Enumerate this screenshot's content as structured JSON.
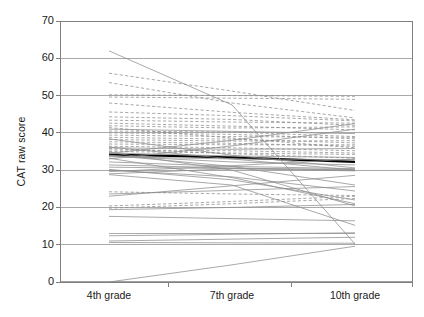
{
  "chart_data": {
    "type": "line",
    "title": "",
    "subtitle": "",
    "xlabel": "",
    "ylabel": "CAT raw score",
    "categories": [
      "4th grade",
      "7th grade",
      "10th grade"
    ],
    "x_tick_labels": [
      "4th grade",
      "7th grade",
      "10th grade"
    ],
    "y_tick_labels": [
      "0",
      "10",
      "20",
      "30",
      "40",
      "50",
      "60",
      "70"
    ],
    "y_ticks": [
      0,
      10,
      20,
      30,
      40,
      50,
      60,
      70
    ],
    "ylim": [
      0,
      70
    ],
    "grid": "horizontal",
    "legend": "none",
    "legend_position": "none",
    "note": "Spaghetti plot: one line per individual across three grades; mix of solid and dashed grey lines with one bold black mean line.",
    "colors": {
      "axis": "#808080",
      "grid": "#a0a0a0",
      "line_solid": "#8c8c8c",
      "line_dashed": "#8c8c8c",
      "line_highlight": "#000000",
      "background": "#ffffff",
      "text": "#1a1a1a"
    },
    "series": [
      {
        "name": "mean",
        "style": "solid-bold",
        "color": "#000000",
        "width": 2.2,
        "values": [
          34.2,
          33.4,
          32.2
        ]
      },
      {
        "name": "s01",
        "style": "solid",
        "values": [
          62.0,
          47.5,
          10.2
        ]
      },
      {
        "name": "s02",
        "style": "dashed",
        "values": [
          56.0,
          51.2,
          46.0
        ]
      },
      {
        "name": "s03",
        "style": "dashed",
        "values": [
          53.5,
          48.0,
          44.0
        ]
      },
      {
        "name": "s04",
        "style": "dashed",
        "values": [
          50.2,
          50.0,
          49.8
        ]
      },
      {
        "name": "s05",
        "style": "dashed",
        "values": [
          49.6,
          49.3,
          49.0
        ]
      },
      {
        "name": "s06",
        "style": "dashed",
        "values": [
          48.0,
          45.5,
          43.5
        ]
      },
      {
        "name": "s07",
        "style": "dashed",
        "values": [
          45.6,
          44.6,
          43.2
        ]
      },
      {
        "name": "s08",
        "style": "dashed",
        "values": [
          44.3,
          43.6,
          42.0
        ]
      },
      {
        "name": "s09",
        "style": "dashed",
        "values": [
          43.4,
          42.9,
          42.6
        ]
      },
      {
        "name": "s10",
        "style": "dashed",
        "values": [
          42.6,
          41.8,
          40.8
        ]
      },
      {
        "name": "s11",
        "style": "dashed",
        "values": [
          41.9,
          41.3,
          41.6
        ]
      },
      {
        "name": "s12",
        "style": "solid",
        "values": [
          41.0,
          40.4,
          39.8
        ]
      },
      {
        "name": "s13",
        "style": "dashed",
        "values": [
          40.5,
          40.2,
          39.0
        ]
      },
      {
        "name": "s14",
        "style": "dashed",
        "values": [
          40.0,
          39.6,
          38.4
        ]
      },
      {
        "name": "s15",
        "style": "dashed",
        "values": [
          39.4,
          39.0,
          38.8
        ]
      },
      {
        "name": "s16",
        "style": "dashed",
        "values": [
          38.8,
          38.3,
          37.3
        ]
      },
      {
        "name": "s17",
        "style": "dashed",
        "values": [
          38.2,
          37.8,
          37.9
        ]
      },
      {
        "name": "s18",
        "style": "dashed",
        "values": [
          37.6,
          37.2,
          36.4
        ]
      },
      {
        "name": "s19",
        "style": "dashed",
        "values": [
          37.0,
          36.8,
          36.8
        ]
      },
      {
        "name": "s20",
        "style": "dashed",
        "values": [
          36.4,
          36.0,
          35.2
        ]
      },
      {
        "name": "s21",
        "style": "solid",
        "values": [
          36.0,
          35.6,
          35.8
        ]
      },
      {
        "name": "s22",
        "style": "dashed",
        "values": [
          35.4,
          35.2,
          34.6
        ]
      },
      {
        "name": "s23",
        "style": "dashed",
        "values": [
          35.0,
          34.6,
          34.2
        ]
      },
      {
        "name": "s24",
        "style": "solid",
        "values": [
          34.6,
          33.8,
          33.4
        ]
      },
      {
        "name": "s25",
        "style": "solid",
        "values": [
          34.0,
          31.0,
          26.0
        ]
      },
      {
        "name": "s26",
        "style": "solid",
        "values": [
          33.6,
          33.0,
          32.8
        ]
      },
      {
        "name": "s27",
        "style": "solid",
        "values": [
          33.2,
          28.0,
          21.0
        ]
      },
      {
        "name": "s28",
        "style": "solid",
        "values": [
          34.5,
          38.0,
          42.5
        ]
      },
      {
        "name": "s29",
        "style": "solid",
        "values": [
          33.0,
          36.5,
          41.0
        ]
      },
      {
        "name": "s30",
        "style": "solid",
        "values": [
          32.2,
          31.0,
          30.4
        ]
      },
      {
        "name": "s31",
        "style": "solid",
        "values": [
          31.4,
          30.6,
          30.0
        ]
      },
      {
        "name": "s32",
        "style": "solid",
        "values": [
          30.8,
          30.4,
          30.2
        ]
      },
      {
        "name": "s33",
        "style": "solid",
        "values": [
          30.2,
          27.4,
          22.0
        ]
      },
      {
        "name": "s34",
        "style": "solid",
        "values": [
          29.6,
          31.2,
          33.0
        ]
      },
      {
        "name": "s35",
        "style": "solid",
        "values": [
          29.0,
          30.4,
          29.8
        ]
      },
      {
        "name": "s36",
        "style": "dashed",
        "values": [
          24.2,
          23.6,
          23.2
        ]
      },
      {
        "name": "s37",
        "style": "solid",
        "values": [
          23.6,
          24.6,
          25.6
        ]
      },
      {
        "name": "s38",
        "style": "solid",
        "values": [
          23.0,
          25.8,
          28.6
        ]
      },
      {
        "name": "s39",
        "style": "dashed",
        "values": [
          20.4,
          21.6,
          23.0
        ]
      },
      {
        "name": "s40",
        "style": "dashed",
        "values": [
          19.8,
          21.0,
          22.4
        ]
      },
      {
        "name": "s41",
        "style": "solid",
        "values": [
          19.4,
          20.0,
          20.8
        ]
      },
      {
        "name": "s42",
        "style": "solid",
        "values": [
          17.6,
          17.0,
          16.4
        ]
      },
      {
        "name": "s43",
        "style": "solid",
        "values": [
          13.0,
          13.0,
          13.0
        ]
      },
      {
        "name": "s44",
        "style": "solid",
        "values": [
          12.4,
          12.8,
          13.2
        ]
      },
      {
        "name": "s45",
        "style": "solid",
        "values": [
          11.0,
          11.5,
          12.0
        ]
      },
      {
        "name": "s46",
        "style": "solid",
        "values": [
          10.6,
          10.5,
          10.4
        ]
      },
      {
        "name": "s47",
        "style": "solid",
        "values": [
          0.0,
          4.6,
          9.6
        ]
      },
      {
        "name": "s48",
        "style": "solid",
        "values": [
          36.2,
          33.0,
          30.0
        ]
      },
      {
        "name": "s49",
        "style": "dashed",
        "values": [
          35.8,
          34.4,
          33.2
        ]
      },
      {
        "name": "s50",
        "style": "solid",
        "values": [
          33.8,
          32.2,
          31.4
        ]
      },
      {
        "name": "s51",
        "style": "solid",
        "values": [
          30.0,
          28.2,
          24.4
        ]
      },
      {
        "name": "s52",
        "style": "solid",
        "values": [
          38.4,
          34.0,
          30.6
        ]
      },
      {
        "name": "s53",
        "style": "dashed",
        "values": [
          41.4,
          38.6,
          36.0
        ]
      },
      {
        "name": "s54",
        "style": "solid",
        "values": [
          28.8,
          26.0,
          15.2
        ]
      },
      {
        "name": "s55",
        "style": "solid",
        "values": [
          34.8,
          30.0,
          20.4
        ]
      }
    ]
  }
}
